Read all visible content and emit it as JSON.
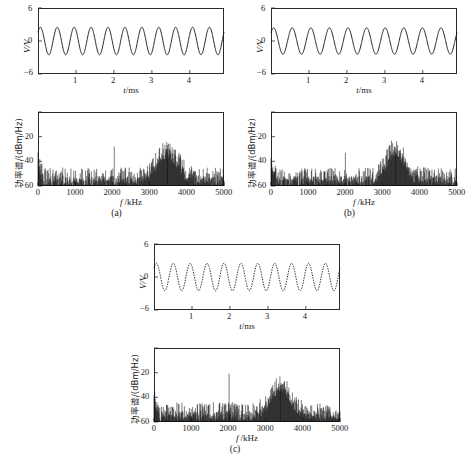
{
  "figure": {
    "panels": [
      {
        "id": "a",
        "caption": "(a)",
        "waveform": {
          "ylabel": "V/V",
          "xlabel": "t/ms",
          "yticks": [
            "6",
            "0",
            "−6"
          ],
          "xticks": [
            "1",
            "2",
            "3",
            "4"
          ],
          "ylim": [
            -6,
            6
          ],
          "xlim": [
            0,
            4.9
          ],
          "amplitude": 2.5,
          "cycles": 11,
          "linestyle": "solid"
        },
        "spectrum": {
          "ylabel": "功率谱/(dBm/Hz)",
          "xlabel": "f /kHz",
          "yticks": [
            "−20",
            "−40",
            "−60"
          ],
          "xticks": [
            "0",
            "1000",
            "2000",
            "3000",
            "4000",
            "5000"
          ],
          "ylim": [
            -60,
            0
          ],
          "xlim": [
            0,
            5000
          ],
          "noise_floor": -54,
          "peaks": [
            {
              "f": 2050,
              "level": -28
            },
            {
              "f": 3480,
              "level": -30
            }
          ],
          "hump": {
            "center": 3480,
            "width": 430,
            "height": 22
          }
        }
      },
      {
        "id": "b",
        "caption": "(b)",
        "waveform": {
          "ylabel": "V/V",
          "xlabel": "t/ms",
          "yticks": [
            "6",
            "0",
            "−6"
          ],
          "xticks": [
            "1",
            "2",
            "3",
            "4"
          ],
          "ylim": [
            -6,
            6
          ],
          "xlim": [
            0,
            4.9
          ],
          "amplitude": 2.4,
          "cycles": 10,
          "linestyle": "solid"
        },
        "spectrum": {
          "ylabel": "功率谱/(dBm/Hz)",
          "xlabel": "f /kHz",
          "yticks": [
            "−20",
            "−40",
            "−60"
          ],
          "xticks": [
            "0",
            "1000",
            "2000",
            "3000",
            "4000",
            "5000"
          ],
          "ylim": [
            -60,
            0
          ],
          "xlim": [
            0,
            5000
          ],
          "noise_floor": -54,
          "peaks": [
            {
              "f": 2000,
              "level": -33
            },
            {
              "f": 3350,
              "level": -29
            }
          ],
          "hump": {
            "center": 3350,
            "width": 380,
            "height": 24
          }
        }
      },
      {
        "id": "c",
        "caption": "(c)",
        "waveform": {
          "ylabel": "V/V",
          "xlabel": "t/ms",
          "yticks": [
            "6",
            "0",
            "−6"
          ],
          "xticks": [
            "1",
            "2",
            "3",
            "4"
          ],
          "ylim": [
            -6,
            6
          ],
          "xlim": [
            0,
            4.9
          ],
          "amplitude": 2.5,
          "cycles": 11,
          "linestyle": "dotted"
        },
        "spectrum": {
          "ylabel": "功率谱/(dBm/Hz)",
          "xlabel": "f /kHz",
          "yticks": [
            "−20",
            "−40",
            "−60"
          ],
          "xticks": [
            "0",
            "1000",
            "2000",
            "3000",
            "4000",
            "5000"
          ],
          "ylim": [
            -60,
            0
          ],
          "xlim": [
            0,
            5000
          ],
          "noise_floor": -53,
          "peaks": [
            {
              "f": 2020,
              "level": -21
            },
            {
              "f": 3400,
              "level": -30
            }
          ],
          "hump": {
            "center": 3400,
            "width": 400,
            "height": 23
          }
        }
      }
    ]
  },
  "chart_data": {
    "type": "line",
    "title": "",
    "subplots": [
      {
        "panel": "a",
        "kind": "time-series",
        "xlabel": "t/ms",
        "ylabel": "V/V",
        "xlim": [
          0,
          4.9
        ],
        "ylim": [
          -6,
          6
        ],
        "xticks": [
          1,
          2,
          3,
          4
        ],
        "yticks": [
          -6,
          0,
          6
        ],
        "series": [
          {
            "name": "waveform",
            "frequency_kHz": 2.24,
            "amplitude_V": 2.5,
            "cycles": 11
          }
        ]
      },
      {
        "panel": "a",
        "kind": "spectrum",
        "xlabel": "f /kHz",
        "ylabel": "功率谱/(dBm/Hz)",
        "xlim": [
          0,
          5000
        ],
        "ylim": [
          -60,
          0
        ],
        "xticks": [
          0,
          1000,
          2000,
          3000,
          4000,
          5000
        ],
        "yticks": [
          -20,
          -40,
          -60
        ],
        "noise_floor_dB": -54,
        "peaks": [
          {
            "f_kHz": 2050,
            "level_dB": -28
          },
          {
            "f_kHz": 3480,
            "level_dB": -30
          }
        ]
      },
      {
        "panel": "b",
        "kind": "time-series",
        "xlabel": "t/ms",
        "ylabel": "V/V",
        "xlim": [
          0,
          4.9
        ],
        "ylim": [
          -6,
          6
        ],
        "xticks": [
          1,
          2,
          3,
          4
        ],
        "yticks": [
          -6,
          0,
          6
        ],
        "series": [
          {
            "name": "waveform",
            "frequency_kHz": 2.04,
            "amplitude_V": 2.4,
            "cycles": 10
          }
        ]
      },
      {
        "panel": "b",
        "kind": "spectrum",
        "xlabel": "f /kHz",
        "ylabel": "功率谱/(dBm/Hz)",
        "xlim": [
          0,
          5000
        ],
        "ylim": [
          -60,
          0
        ],
        "xticks": [
          0,
          1000,
          2000,
          3000,
          4000,
          5000
        ],
        "yticks": [
          -20,
          -40,
          -60
        ],
        "noise_floor_dB": -54,
        "peaks": [
          {
            "f_kHz": 2000,
            "level_dB": -33
          },
          {
            "f_kHz": 3350,
            "level_dB": -29
          }
        ]
      },
      {
        "panel": "c",
        "kind": "time-series",
        "xlabel": "t/ms",
        "ylabel": "V/V",
        "xlim": [
          0,
          4.9
        ],
        "ylim": [
          -6,
          6
        ],
        "xticks": [
          1,
          2,
          3,
          4
        ],
        "yticks": [
          -6,
          0,
          6
        ],
        "series": [
          {
            "name": "waveform",
            "frequency_kHz": 2.24,
            "amplitude_V": 2.5,
            "cycles": 11,
            "style": "dotted"
          }
        ]
      },
      {
        "panel": "c",
        "kind": "spectrum",
        "xlabel": "f /kHz",
        "ylabel": "功率谱/(dBm/Hz)",
        "xlim": [
          0,
          5000
        ],
        "ylim": [
          -60,
          0
        ],
        "xticks": [
          0,
          1000,
          2000,
          3000,
          4000,
          5000
        ],
        "yticks": [
          -20,
          -40,
          -60
        ],
        "noise_floor_dB": -53,
        "peaks": [
          {
            "f_kHz": 2020,
            "level_dB": -21
          },
          {
            "f_kHz": 3400,
            "level_dB": -30
          }
        ]
      }
    ]
  }
}
